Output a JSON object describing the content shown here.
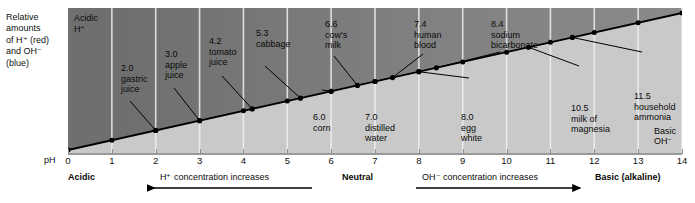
{
  "legend": {
    "lines": [
      "Relative",
      "amounts",
      "of H⁺ (red)",
      "and OH⁻",
      "(blue)"
    ]
  },
  "plot": {
    "acidic_corner": {
      "line1": "Acidic",
      "line2": "H⁺"
    },
    "basic_corner": {
      "line1": "Basic",
      "line2": "OH⁻"
    }
  },
  "axis": {
    "ph_caption": "pH",
    "ticks": [
      "0",
      "1",
      "2",
      "3",
      "4",
      "5",
      "6",
      "7",
      "8",
      "9",
      "10",
      "11",
      "12",
      "13",
      "14"
    ],
    "min": 0,
    "max": 14
  },
  "captions": {
    "acidic": "Acidic",
    "neutral": "Neutral",
    "basic": "Basic (alkaline)",
    "h_increase": "H⁺ concentration increases",
    "oh_increase": "OH⁻ concentration increases",
    "h_arrow_direction": "left",
    "oh_arrow_direction": "right"
  },
  "colors": {
    "upper_band_dark": "#6f6f6f",
    "upper_band_light": "#8a8a8a",
    "lower_band": "#c9c9c9",
    "gridline": "#f0f0f0",
    "line": "#000000",
    "text": "#0a0a0a"
  },
  "chart_data": {
    "type": "line",
    "title": "",
    "xlabel": "pH",
    "ylabel": "Relative amounts of H+ (red) and OH- (blue)",
    "xlim": [
      0,
      14
    ],
    "ylim": [
      0,
      1
    ],
    "grid": true,
    "legend_position": "none",
    "x": [
      0,
      1,
      2,
      3,
      4,
      5,
      6,
      7,
      8,
      9,
      10,
      11,
      12,
      13,
      14
    ],
    "series": [
      {
        "name": "OH⁻ relative amount",
        "values": [
          0.0,
          0.0714,
          0.1429,
          0.2143,
          0.2857,
          0.3571,
          0.4286,
          0.5,
          0.5714,
          0.6429,
          0.7143,
          0.7857,
          0.8571,
          0.9286,
          1.0
        ]
      }
    ],
    "annotations": [
      {
        "ph": 2.0,
        "value": "2.0",
        "label": "gastric juice",
        "label_lines": [
          "2.0",
          "gastric",
          "juice"
        ],
        "side": "above"
      },
      {
        "ph": 3.0,
        "value": "3.0",
        "label": "apple juice",
        "label_lines": [
          "3.0",
          "apple",
          "juice"
        ],
        "side": "above"
      },
      {
        "ph": 4.2,
        "value": "4.2",
        "label": "tomato juice",
        "label_lines": [
          "4.2",
          "tomato",
          "juice"
        ],
        "side": "above"
      },
      {
        "ph": 5.3,
        "value": "5.3",
        "label": "cabbage",
        "label_lines": [
          "5.3",
          "cabbage"
        ],
        "side": "above"
      },
      {
        "ph": 6.0,
        "value": "6.0",
        "label": "corn",
        "label_lines": [
          "6.0",
          "corn"
        ],
        "side": "below"
      },
      {
        "ph": 6.6,
        "value": "6.6",
        "label": "cow's milk",
        "label_lines": [
          "6.6",
          "cow's",
          "milk"
        ],
        "side": "above"
      },
      {
        "ph": 7.0,
        "value": "7.0",
        "label": "distilled water",
        "label_lines": [
          "7.0",
          "distilled",
          "water"
        ],
        "side": "below"
      },
      {
        "ph": 7.4,
        "value": "7.4",
        "label": "human blood",
        "label_lines": [
          "7.4",
          "human",
          "blood"
        ],
        "side": "above"
      },
      {
        "ph": 8.0,
        "value": "8.0",
        "label": "egg white",
        "label_lines": [
          "8.0",
          "egg",
          "white"
        ],
        "side": "below"
      },
      {
        "ph": 8.4,
        "value": "8.4",
        "label": "sodium bicarbonate",
        "label_lines": [
          "8.4",
          "sodium",
          "bicarbonate"
        ],
        "side": "above"
      },
      {
        "ph": 10.5,
        "value": "10.5",
        "label": "milk of magnesia",
        "label_lines": [
          "10.5",
          "milk of",
          "magnesia"
        ],
        "side": "below"
      },
      {
        "ph": 11.5,
        "value": "11.5",
        "label": "household ammonia",
        "label_lines": [
          "11.5",
          "household",
          "ammonia"
        ],
        "side": "below"
      }
    ]
  }
}
